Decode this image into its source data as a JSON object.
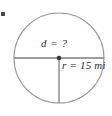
{
  "figure": {
    "type": "geometry-diagram",
    "shape": "circle",
    "background_color": "#ffffff",
    "outline_color": "#9a9a9a",
    "line_color": "#8a8a8a",
    "text_color": "#2b2b2b",
    "center_dot_color": "#3a3a3a",
    "labels": {
      "diameter": {
        "variable": "d",
        "operator": "=",
        "value": "?",
        "full_text": "d = ?"
      },
      "radius": {
        "variable": "r",
        "operator": "=",
        "value": "15",
        "unit": "mi",
        "full_text": "r = 15 mi"
      }
    },
    "geometry": {
      "center_x": 59,
      "center_y": 58,
      "radius_px": 45,
      "circle_left": 14,
      "circle_right": 104,
      "circle_top": 13,
      "circle_bottom": 103,
      "diameter_line": "horizontal through center",
      "radius_line": "vertical from center downward"
    },
    "corner_mark": {
      "name": "edge-tick-mark",
      "x": 1,
      "y": 12,
      "width": 4,
      "height": 4,
      "color": "#4a4a4a"
    }
  }
}
